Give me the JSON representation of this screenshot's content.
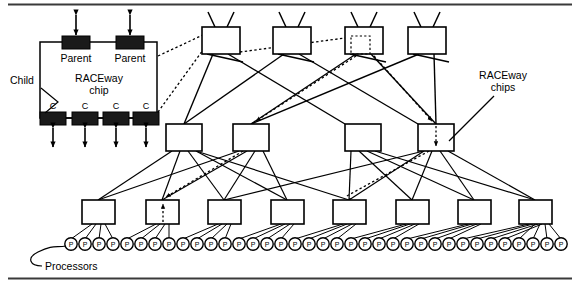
{
  "figure": {
    "type": "network-topology-diagram",
    "labels": {
      "child": "Child",
      "parent_left": "Parent",
      "parent_right": "Parent",
      "chip_title_line1": "RACEway",
      "chip_title_line2": "chip",
      "raceway_chips_line1": "RACEway",
      "raceway_chips_line2": "chips",
      "processors": "Processors",
      "child_port": "C",
      "processor_glyph": "P"
    },
    "colors": {
      "line": "#000000",
      "block_fill": "#1a1a1a",
      "box_fill": "#ffffff",
      "background": "#ffffff",
      "rule": "#333333"
    },
    "inset": {
      "frame": {
        "x": 40,
        "y": 42,
        "w": 117,
        "h": 76
      },
      "parents": [
        {
          "label": "Parent",
          "x": 62,
          "y": 36,
          "w": 28,
          "h": 13
        },
        {
          "label": "Parent",
          "x": 116,
          "y": 36,
          "w": 28,
          "h": 13
        }
      ],
      "children": [
        {
          "label": "C",
          "x": 40,
          "y": 112,
          "w": 26,
          "h": 13
        },
        {
          "label": "C",
          "x": 72,
          "y": 112,
          "w": 26,
          "h": 13
        },
        {
          "label": "C",
          "x": 103,
          "y": 112,
          "w": 26,
          "h": 13
        },
        {
          "label": "C",
          "x": 133,
          "y": 112,
          "w": 26,
          "h": 13
        }
      ],
      "parent_arrows": 2,
      "child_arrows": 4,
      "arrow_style": "double-headed"
    },
    "tree": {
      "levels": [
        {
          "name": "root-switches",
          "count": 4,
          "has_antennae": true,
          "x_positions": [
            202,
            273,
            345,
            408
          ],
          "y": 27,
          "w": 38,
          "h": 27
        },
        {
          "name": "mid-switches",
          "count": 4,
          "x_positions": [
            166,
            233,
            345,
            418
          ],
          "y": 124,
          "w": 36,
          "h": 27
        },
        {
          "name": "leaf-switches",
          "count": 8,
          "x_positions": [
            82,
            146,
            208,
            271,
            333,
            396,
            458,
            519
          ],
          "y": 200,
          "w": 33,
          "h": 24
        }
      ],
      "processors_per_leaf": 4,
      "processor_count": 32,
      "processor_row_y": 244,
      "processor_radius": 6.2
    },
    "highlighted_path": {
      "style": "dotted",
      "description": "routed path traced through the fat tree with arrowheads",
      "arrow_targets": [
        "root-switch-3",
        "mid-switch-2",
        "mid-switch-4",
        "leaf-switch-2",
        "leaf-switch-5"
      ]
    },
    "rules": {
      "top_y": 4,
      "bottom_y": 278
    }
  }
}
